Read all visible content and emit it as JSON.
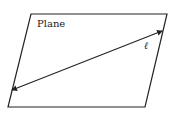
{
  "diagram": {
    "plane_label": "Plane",
    "line_label": "ℓ",
    "stroke_color": "#222222",
    "background": "#ffffff",
    "plane": {
      "points": [
        [
          31,
          14
        ],
        [
          167,
          14
        ],
        [
          145,
          107
        ],
        [
          8,
          107
        ]
      ]
    },
    "line": {
      "from": [
        12,
        90
      ],
      "to": [
        162,
        31
      ],
      "arrows": "both"
    }
  }
}
